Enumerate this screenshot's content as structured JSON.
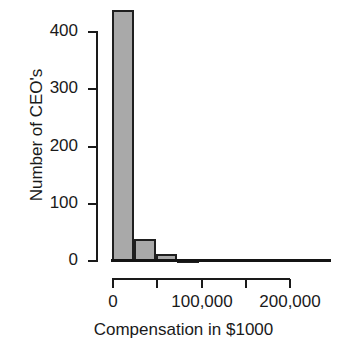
{
  "chart_data": {
    "type": "bar",
    "title": "",
    "subtitle": "",
    "xlabel": "Compensation in $1000",
    "ylabel": "Number of CEO's",
    "grid": false,
    "legend": "none",
    "bin_width": 25000,
    "xlim": [
      0,
      250000
    ],
    "ylim": [
      0,
      450
    ],
    "x_ticks": [
      0,
      50000,
      100000,
      150000,
      200000
    ],
    "x_tick_labels": [
      "0",
      "",
      "100,000",
      "",
      "200,000"
    ],
    "y_ticks": [
      0,
      100,
      200,
      300,
      400
    ],
    "y_tick_labels": [
      "0",
      "100",
      "200",
      "300",
      "400"
    ],
    "bins": [
      {
        "start": 0,
        "end": 25000,
        "count": 437
      },
      {
        "start": 25000,
        "end": 50000,
        "count": 38
      },
      {
        "start": 50000,
        "end": 75000,
        "count": 12
      },
      {
        "start": 75000,
        "end": 100000,
        "count": 3
      },
      {
        "start": 100000,
        "end": 125000,
        "count": 0
      },
      {
        "start": 125000,
        "end": 150000,
        "count": 0
      },
      {
        "start": 150000,
        "end": 175000,
        "count": 0
      },
      {
        "start": 175000,
        "end": 200000,
        "count": 0
      },
      {
        "start": 200000,
        "end": 225000,
        "count": 0
      },
      {
        "start": 225000,
        "end": 250000,
        "count": 0
      }
    ],
    "categories": [
      "0-25,000",
      "25,000-50,000",
      "50,000-75,000",
      "75,000-100,000",
      "100,000-125,000",
      "125,000-150,000",
      "150,000-175,000",
      "175,000-200,000",
      "200,000-225,000",
      "225,000-250,000"
    ],
    "values": [
      437,
      38,
      12,
      3,
      0,
      0,
      0,
      0,
      0,
      0
    ],
    "colors": {
      "bar_fill": "#a9a9a9",
      "bar_border": "#1f1f1f",
      "axis": "#1a1a1a",
      "background": "#ffffff"
    }
  }
}
